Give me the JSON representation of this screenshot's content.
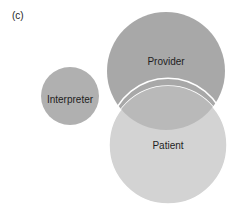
{
  "panel_label": "(c)",
  "circles": {
    "provider": {
      "label": "Provider",
      "color": "#a8a8a8"
    },
    "patient": {
      "label": "Patient",
      "color": "#d3d3d3"
    },
    "interpreter": {
      "label": "Interpreter",
      "color": "#b0b0b0"
    }
  },
  "overlap_color": "#b8b8b8"
}
